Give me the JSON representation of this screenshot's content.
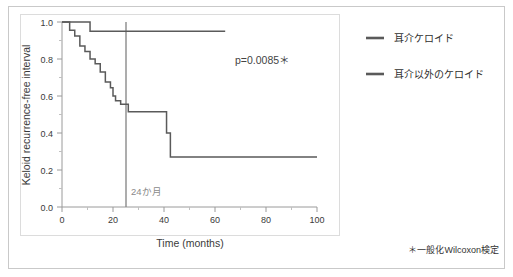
{
  "chart_data": {
    "type": "line",
    "subtype": "kaplan-meier-step",
    "title": "",
    "xlabel": "Time (months)",
    "ylabel": "Keloid recurrence-free interval",
    "xlim": [
      0,
      100
    ],
    "ylim": [
      0.0,
      1.0
    ],
    "xticks": [
      0,
      20,
      40,
      60,
      80,
      100
    ],
    "xtick_labels": [
      "0",
      "20",
      "40",
      "60",
      "80",
      "100"
    ],
    "yticks": [
      0.0,
      0.2,
      0.4,
      0.6,
      0.8,
      1.0
    ],
    "ytick_labels": [
      "0.0",
      "0.2",
      "0.4",
      "0.6",
      "0.8",
      "1.0"
    ],
    "grid": false,
    "legend_position": "right-outside",
    "series": [
      {
        "name": "耳介ケロイド",
        "color": "#5a5a5a",
        "points": [
          [
            0,
            1.0
          ],
          [
            11,
            1.0
          ],
          [
            11,
            0.95
          ],
          [
            64,
            0.95
          ]
        ]
      },
      {
        "name": "耳介以外のケロイド",
        "color": "#5a5a5a",
        "points": [
          [
            0,
            1.0
          ],
          [
            3,
            1.0
          ],
          [
            3,
            0.955
          ],
          [
            5,
            0.955
          ],
          [
            5,
            0.925
          ],
          [
            7,
            0.925
          ],
          [
            7,
            0.87
          ],
          [
            9,
            0.87
          ],
          [
            9,
            0.84
          ],
          [
            11,
            0.84
          ],
          [
            11,
            0.8
          ],
          [
            13,
            0.8
          ],
          [
            13,
            0.775
          ],
          [
            15,
            0.775
          ],
          [
            15,
            0.73
          ],
          [
            17,
            0.73
          ],
          [
            17,
            0.675
          ],
          [
            19,
            0.675
          ],
          [
            19,
            0.645
          ],
          [
            20,
            0.645
          ],
          [
            20,
            0.6
          ],
          [
            21,
            0.6
          ],
          [
            21,
            0.575
          ],
          [
            23,
            0.575
          ],
          [
            23,
            0.555
          ],
          [
            26,
            0.555
          ],
          [
            26,
            0.515
          ],
          [
            41,
            0.515
          ],
          [
            41,
            0.4
          ],
          [
            42.5,
            0.4
          ],
          [
            42.5,
            0.27
          ],
          [
            100,
            0.27
          ]
        ]
      }
    ],
    "annotations": [
      {
        "name": "p-value",
        "text": "p=0.0085＊",
        "x": 72,
        "y": 0.78
      },
      {
        "name": "reference-line-label",
        "text": "24か月",
        "x": 26,
        "y": 0.085
      }
    ],
    "reference_line": {
      "name": "24-month-reference-line",
      "x": 25,
      "color": "#8a8a8a",
      "label": "24か月"
    }
  },
  "legend": {
    "items": [
      {
        "label": "耳介ケロイド",
        "color": "#5a5a5a"
      },
      {
        "label": "耳介以外のケロイド",
        "color": "#5a5a5a"
      }
    ]
  },
  "axes": {
    "x_title": "Time (months)",
    "y_title": "Keloid recurrence-free interval",
    "x_tick_0": "0",
    "x_tick_1": "20",
    "x_tick_2": "40",
    "x_tick_3": "60",
    "x_tick_4": "80",
    "x_tick_5": "100",
    "y_tick_0": "0.0",
    "y_tick_1": "0.2",
    "y_tick_2": "0.4",
    "y_tick_3": "0.6",
    "y_tick_4": "0.8",
    "y_tick_5": "1.0"
  },
  "annotations": {
    "p_value": "p=0.0085＊",
    "reference_label": "24か月"
  },
  "footnote": {
    "text": "＊一般化Wilcoxon検定"
  },
  "colors": {
    "curve": "#5a5a5a",
    "reference_line": "#8a8a8a",
    "axis": "#b4b4b4",
    "frame": "#c9c9c9",
    "text": "#333333"
  }
}
